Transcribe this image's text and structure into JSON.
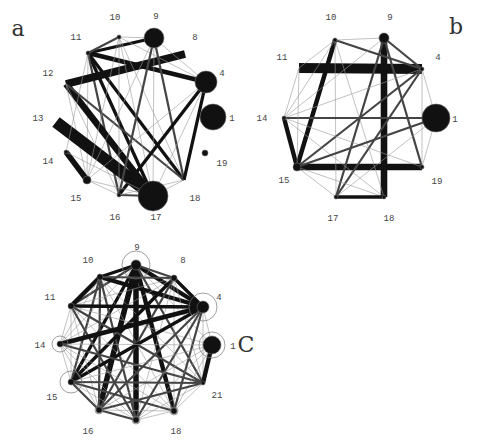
{
  "figure": {
    "panels": [
      {
        "id": "a",
        "letter": "a",
        "letter_pos": [
          18,
          36
        ],
        "nodes": [
          {
            "id": "10",
            "label": "10",
            "x": 119,
            "y": 37,
            "r": 2,
            "lx": 115,
            "ly": 20
          },
          {
            "id": "9",
            "label": "9",
            "x": 154,
            "y": 38,
            "r": 10,
            "lx": 156,
            "ly": 19
          },
          {
            "id": "8",
            "label": "8",
            "x": 185,
            "y": 54,
            "r": 0,
            "lx": 195,
            "ly": 40
          },
          {
            "id": "11",
            "label": "11",
            "x": 88,
            "y": 53,
            "r": 2,
            "lx": 76,
            "ly": 40
          },
          {
            "id": "4",
            "label": "4",
            "x": 206,
            "y": 82,
            "r": 11,
            "lx": 222,
            "ly": 76
          },
          {
            "id": "12",
            "label": "12",
            "x": 66,
            "y": 84,
            "r": 0,
            "lx": 48,
            "ly": 76
          },
          {
            "id": "1",
            "label": "1",
            "x": 213,
            "y": 117,
            "r": 13,
            "lx": 232,
            "ly": 121
          },
          {
            "id": "13",
            "label": "13",
            "x": 56,
            "y": 122,
            "r": 0,
            "lx": 38,
            "ly": 121
          },
          {
            "id": "19",
            "label": "19",
            "x": 205,
            "y": 153,
            "r": 3,
            "lx": 222,
            "ly": 166
          },
          {
            "id": "14",
            "label": "14",
            "x": 66,
            "y": 152,
            "r": 2,
            "lx": 48,
            "ly": 164
          },
          {
            "id": "15",
            "label": "15",
            "x": 87,
            "y": 180,
            "r": 4,
            "lx": 76,
            "ly": 201
          },
          {
            "id": "18",
            "label": "18",
            "x": 184,
            "y": 180,
            "r": 0,
            "lx": 195,
            "ly": 201
          },
          {
            "id": "16",
            "label": "16",
            "x": 119,
            "y": 195,
            "r": 2,
            "lx": 115,
            "ly": 220
          },
          {
            "id": "17",
            "label": "17",
            "x": 153,
            "y": 196,
            "r": 15,
            "lx": 156,
            "ly": 220
          }
        ],
        "edges": [
          [
            "11",
            "9",
            3
          ],
          [
            "11",
            "4",
            4
          ],
          [
            "11",
            "17",
            3
          ],
          [
            "11",
            "18",
            3
          ],
          [
            "11",
            "16",
            2
          ],
          [
            "11",
            "15",
            1
          ],
          [
            "11",
            "10",
            2
          ],
          [
            "12",
            "8",
            7
          ],
          [
            "12",
            "17",
            6
          ],
          [
            "12",
            "18",
            2
          ],
          [
            "12",
            "16",
            1
          ],
          [
            "12",
            "15",
            1
          ],
          [
            "13",
            "17",
            11
          ],
          [
            "14",
            "15",
            5
          ],
          [
            "10",
            "9",
            1
          ],
          [
            "10",
            "4",
            1
          ],
          [
            "10",
            "17",
            1
          ],
          [
            "10",
            "16",
            1
          ],
          [
            "10",
            "15",
            1
          ],
          [
            "10",
            "18",
            1
          ],
          [
            "9",
            "16",
            2
          ],
          [
            "9",
            "18",
            2
          ],
          [
            "9",
            "15",
            1
          ],
          [
            "9",
            "4",
            1
          ],
          [
            "9",
            "17",
            1
          ],
          [
            "4",
            "16",
            3
          ],
          [
            "4",
            "18",
            3
          ],
          [
            "4",
            "15",
            1
          ],
          [
            "4",
            "17",
            1
          ],
          [
            "16",
            "17",
            2
          ],
          [
            "15",
            "17",
            1
          ],
          [
            "15",
            "16",
            1
          ],
          [
            "16",
            "18",
            1
          ],
          [
            "17",
            "18",
            1
          ],
          [
            "14",
            "17",
            1
          ],
          [
            "14",
            "11",
            1
          ]
        ]
      },
      {
        "id": "b",
        "letter": "b",
        "letter_pos": [
          456,
          34
        ],
        "nodes": [
          {
            "id": "10",
            "label": "10",
            "x": 335,
            "y": 40,
            "r": 2,
            "lx": 331,
            "ly": 20
          },
          {
            "id": "9",
            "label": "9",
            "x": 384,
            "y": 38,
            "r": 5,
            "lx": 390,
            "ly": 20
          },
          {
            "id": "11",
            "label": "11",
            "x": 299,
            "y": 68,
            "r": 0,
            "lx": 282,
            "ly": 60
          },
          {
            "id": "4",
            "label": "4",
            "x": 422,
            "y": 69,
            "r": 2,
            "lx": 438,
            "ly": 60
          },
          {
            "id": "14",
            "label": "14",
            "x": 284,
            "y": 118,
            "r": 2,
            "lx": 262,
            "ly": 121
          },
          {
            "id": "1",
            "label": "1",
            "x": 436,
            "y": 118,
            "r": 14,
            "lx": 455,
            "ly": 122
          },
          {
            "id": "15",
            "label": "15",
            "x": 297,
            "y": 167,
            "r": 4,
            "lx": 284,
            "ly": 183
          },
          {
            "id": "19",
            "label": "19",
            "x": 422,
            "y": 167,
            "r": 2,
            "lx": 437,
            "ly": 184
          },
          {
            "id": "17",
            "label": "17",
            "x": 336,
            "y": 197,
            "r": 2,
            "lx": 333,
            "ly": 221
          },
          {
            "id": "18",
            "label": "18",
            "x": 384,
            "y": 197,
            "r": 2,
            "lx": 389,
            "ly": 221
          }
        ],
        "edges": [
          [
            "11",
            "4",
            9
          ],
          [
            "9",
            "18",
            6
          ],
          [
            "15",
            "19",
            6
          ],
          [
            "10",
            "15",
            4
          ],
          [
            "10",
            "4",
            2
          ],
          [
            "10",
            "9",
            1
          ],
          [
            "10",
            "11",
            1
          ],
          [
            "10",
            "14",
            1
          ],
          [
            "10",
            "17",
            1
          ],
          [
            "10",
            "18",
            1
          ],
          [
            "9",
            "4",
            2
          ],
          [
            "9",
            "19",
            2
          ],
          [
            "9",
            "14",
            1
          ],
          [
            "9",
            "17",
            2
          ],
          [
            "4",
            "15",
            2
          ],
          [
            "4",
            "17",
            2
          ],
          [
            "4",
            "14",
            1
          ],
          [
            "4",
            "1",
            1
          ],
          [
            "4",
            "19",
            1
          ],
          [
            "14",
            "1",
            2
          ],
          [
            "14",
            "15",
            4
          ],
          [
            "14",
            "19",
            1
          ],
          [
            "14",
            "18",
            1
          ],
          [
            "15",
            "1",
            2
          ],
          [
            "15",
            "17",
            1
          ],
          [
            "15",
            "18",
            1
          ],
          [
            "17",
            "18",
            3
          ],
          [
            "17",
            "1",
            1
          ],
          [
            "1",
            "19",
            1
          ],
          [
            "11",
            "14",
            1
          ],
          [
            "11",
            "15",
            1
          ]
        ]
      },
      {
        "id": "c",
        "letter": "C",
        "letter_pos": [
          246,
          352
        ],
        "nodes": [
          {
            "id": "9",
            "label": "9",
            "x": 136,
            "y": 265,
            "r": 5,
            "halo": 14,
            "lx": 137,
            "ly": 250
          },
          {
            "id": "10",
            "label": "10",
            "x": 100,
            "y": 277,
            "r": 3,
            "halo": 0,
            "lx": 88,
            "ly": 263
          },
          {
            "id": "8",
            "label": "8",
            "x": 174,
            "y": 278,
            "r": 3,
            "halo": 0,
            "lx": 183,
            "ly": 263
          },
          {
            "id": "11",
            "label": "11",
            "x": 71,
            "y": 306,
            "r": 3,
            "halo": 0,
            "lx": 50,
            "ly": 300
          },
          {
            "id": "4",
            "label": "4",
            "x": 203,
            "y": 307,
            "r": 6,
            "halo": 14,
            "lx": 219,
            "ly": 300
          },
          {
            "id": "14",
            "label": "14",
            "x": 60,
            "y": 344,
            "r": 3,
            "halo": 8,
            "lx": 40,
            "ly": 348
          },
          {
            "id": "1",
            "label": "1",
            "x": 212,
            "y": 345,
            "r": 9,
            "halo": 13,
            "lx": 233,
            "ly": 349
          },
          {
            "id": "15",
            "label": "15",
            "x": 71,
            "y": 382,
            "r": 3,
            "halo": 11,
            "lx": 52,
            "ly": 400
          },
          {
            "id": "21",
            "label": "21",
            "x": 203,
            "y": 383,
            "r": 2,
            "halo": 0,
            "lx": 217,
            "ly": 398
          },
          {
            "id": "16",
            "label": "16",
            "x": 99,
            "y": 410,
            "r": 3,
            "halo": 4,
            "lx": 88,
            "ly": 434
          },
          {
            "id": "17",
            "label": "",
            "x": 136,
            "y": 420,
            "r": 3,
            "halo": 4,
            "lx": 0,
            "ly": 0
          },
          {
            "id": "18",
            "label": "18",
            "x": 174,
            "y": 411,
            "r": 3,
            "halo": 4,
            "lx": 176,
            "ly": 434
          }
        ],
        "edges": [
          [
            "9",
            "16",
            5
          ],
          [
            "9",
            "17",
            5
          ],
          [
            "9",
            "18",
            4
          ],
          [
            "9",
            "15",
            3
          ],
          [
            "9",
            "4",
            4
          ],
          [
            "9",
            "10",
            3
          ],
          [
            "9",
            "11",
            2
          ],
          [
            "9",
            "8",
            2
          ],
          [
            "9",
            "21",
            2
          ],
          [
            "9",
            "14",
            1
          ],
          [
            "9",
            "1",
            1
          ],
          [
            "10",
            "4",
            4
          ],
          [
            "10",
            "11",
            4
          ],
          [
            "10",
            "15",
            2
          ],
          [
            "10",
            "16",
            2
          ],
          [
            "10",
            "17",
            2
          ],
          [
            "10",
            "18",
            1
          ],
          [
            "10",
            "8",
            2
          ],
          [
            "10",
            "21",
            1
          ],
          [
            "10",
            "14",
            1
          ],
          [
            "8",
            "4",
            3
          ],
          [
            "8",
            "15",
            3
          ],
          [
            "8",
            "16",
            2
          ],
          [
            "8",
            "11",
            1
          ],
          [
            "8",
            "14",
            1
          ],
          [
            "8",
            "17",
            1
          ],
          [
            "8",
            "18",
            1
          ],
          [
            "8",
            "21",
            1
          ],
          [
            "11",
            "4",
            3
          ],
          [
            "11",
            "21",
            2
          ],
          [
            "11",
            "17",
            2
          ],
          [
            "11",
            "18",
            1
          ],
          [
            "11",
            "16",
            1
          ],
          [
            "11",
            "15",
            1
          ],
          [
            "11",
            "14",
            1
          ],
          [
            "11",
            "1",
            1
          ],
          [
            "4",
            "14",
            4
          ],
          [
            "4",
            "15",
            3
          ],
          [
            "4",
            "16",
            2
          ],
          [
            "4",
            "17",
            2
          ],
          [
            "4",
            "18",
            2
          ],
          [
            "4",
            "21",
            1
          ],
          [
            "4",
            "1",
            1
          ],
          [
            "14",
            "1",
            1
          ],
          [
            "14",
            "21",
            2
          ],
          [
            "14",
            "18",
            1
          ],
          [
            "14",
            "17",
            1
          ],
          [
            "14",
            "16",
            1
          ],
          [
            "14",
            "15",
            1
          ],
          [
            "1",
            "21",
            4
          ],
          [
            "1",
            "15",
            1
          ],
          [
            "1",
            "16",
            1
          ],
          [
            "1",
            "17",
            1
          ],
          [
            "1",
            "18",
            1
          ],
          [
            "15",
            "21",
            2
          ],
          [
            "15",
            "18",
            2
          ],
          [
            "15",
            "17",
            1
          ],
          [
            "15",
            "16",
            2
          ],
          [
            "21",
            "16",
            2
          ],
          [
            "21",
            "17",
            1
          ],
          [
            "21",
            "18",
            1
          ],
          [
            "16",
            "17",
            2
          ],
          [
            "17",
            "18",
            1
          ],
          [
            "16",
            "18",
            1
          ]
        ]
      }
    ]
  }
}
